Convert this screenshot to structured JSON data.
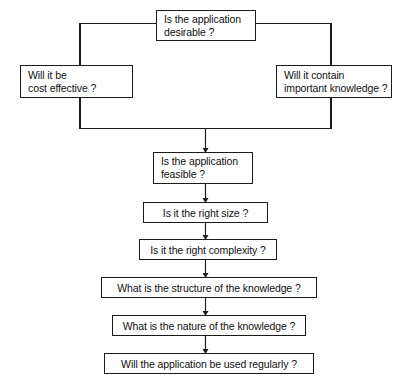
{
  "diagram": {
    "ink_color": "#1a1a1a",
    "background_color": "#ffffff",
    "nodes": [
      {
        "id": "desirable",
        "name": "node-is-application-desirable",
        "lines": [
          "Is the application",
          "desirable ?"
        ],
        "x": 156,
        "y": 10,
        "w": 100,
        "h": 31
      },
      {
        "id": "cost",
        "name": "node-cost-effective",
        "lines": [
          "Will it be",
          "cost effective ?"
        ],
        "x": 20,
        "y": 65,
        "w": 113,
        "h": 33
      },
      {
        "id": "knowledge",
        "name": "node-important-knowledge",
        "lines": [
          "Will it contain",
          "important knowledge ?"
        ],
        "x": 276,
        "y": 65,
        "w": 116,
        "h": 33
      },
      {
        "id": "feasible",
        "name": "node-is-application-feasible",
        "lines": [
          "Is the application",
          "feasible ?"
        ],
        "x": 153,
        "y": 152,
        "w": 100,
        "h": 32
      },
      {
        "id": "size",
        "name": "node-right-size",
        "lines": [
          "Is it the right size ?"
        ],
        "x": 143,
        "y": 202,
        "w": 125,
        "h": 21
      },
      {
        "id": "complexity",
        "name": "node-right-complexity",
        "lines": [
          "Is it the right complexity ?"
        ],
        "x": 139,
        "y": 239,
        "w": 138,
        "h": 21
      },
      {
        "id": "structure",
        "name": "node-structure-of-knowledge",
        "lines": [
          "What is the structure of the knowledge ?"
        ],
        "x": 101,
        "y": 277,
        "w": 216,
        "h": 21
      },
      {
        "id": "nature",
        "name": "node-nature-of-knowledge",
        "lines": [
          "What is the nature of the knowledge ?"
        ],
        "x": 112,
        "y": 315,
        "w": 194,
        "h": 21
      },
      {
        "id": "regularly",
        "name": "node-used-regularly",
        "lines": [
          "Will the application be used regularly ?"
        ],
        "x": 104,
        "y": 353,
        "w": 210,
        "h": 21
      }
    ],
    "connectors": [
      {
        "name": "connector-desirable-to-cost",
        "kind": "elbow-left"
      },
      {
        "name": "connector-desirable-to-knowledge",
        "kind": "elbow-right"
      },
      {
        "name": "connector-cost-to-merge",
        "kind": "vertical"
      },
      {
        "name": "connector-knowledge-to-merge",
        "kind": "vertical"
      },
      {
        "name": "connector-merge-bar",
        "kind": "horizontal"
      },
      {
        "name": "connector-merge-to-feasible",
        "kind": "arrow-down"
      },
      {
        "name": "connector-feasible-to-size",
        "kind": "arrow-down"
      },
      {
        "name": "connector-size-to-complexity",
        "kind": "arrow-down"
      },
      {
        "name": "connector-complexity-to-structure",
        "kind": "arrow-down"
      },
      {
        "name": "connector-structure-to-nature",
        "kind": "arrow-down"
      },
      {
        "name": "connector-nature-to-regularly",
        "kind": "arrow-down"
      }
    ]
  }
}
